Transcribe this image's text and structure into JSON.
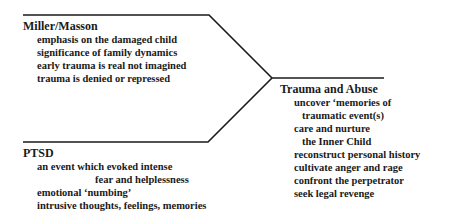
{
  "diagram": {
    "type": "converging-branches",
    "branches": [
      {
        "id": "miller-masson",
        "title": "Miller/Masson",
        "items": [
          "emphasis on the damaged child",
          "significance of family dynamics",
          "early trauma is real not imagined",
          "trauma is denied or repressed"
        ]
      },
      {
        "id": "ptsd",
        "title": "PTSD",
        "items": [
          "an event which evoked intense",
          "fear and helplessness",
          "emotional ‘numbing’",
          "intrusive thoughts, feelings, memories"
        ]
      }
    ],
    "result": {
      "id": "trauma-and-abuse",
      "title": "Trauma and Abuse",
      "items": [
        "uncover ‘memories of",
        "traumatic event(s)",
        "care and nurture",
        "the Inner Child",
        "reconstruct personal history",
        "cultivate anger and rage",
        "confront the perpetrator",
        "seek legal revenge"
      ]
    },
    "line_color": "#1a1a1a"
  }
}
